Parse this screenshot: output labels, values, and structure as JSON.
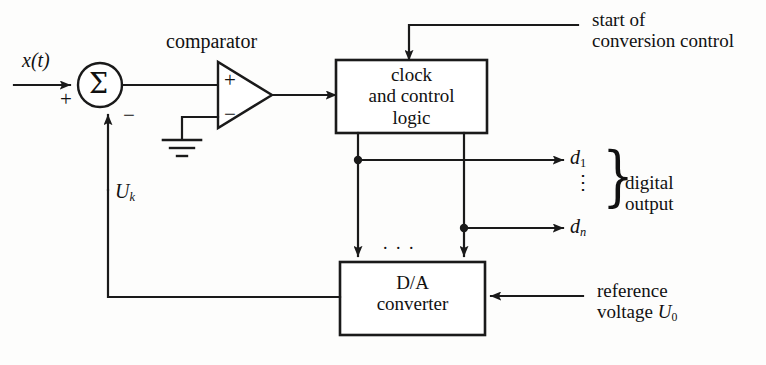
{
  "diagram": {
    "line_color": "#1a1a1a",
    "background": "#fdfdfc",
    "labels": {
      "input_signal": "x",
      "input_signal_arg": "(t)",
      "comparator": "comparator",
      "sum_symbol": "Σ",
      "plus_sign": "+",
      "minus_sign": "−",
      "comparator_plus": "+",
      "comparator_minus": "−",
      "feedback_voltage": "U",
      "feedback_voltage_sub": "k",
      "clock_block_line1": "clock",
      "clock_block_line2": "and control",
      "clock_block_line3": "logic",
      "start_control_line1": "start of",
      "start_control_line2": "conversion control",
      "bit_first": "d",
      "bit_first_sub": "1",
      "bit_last": "d",
      "bit_last_sub": "n",
      "bits_ellipsis": "⋮",
      "digital_output_line1": "digital",
      "digital_output_line2": "output",
      "bus_ellipsis": ". . .",
      "dac_block_line1": "D/A",
      "dac_block_line2": "converter",
      "reference_line1": "reference",
      "reference_line2_text": "voltage",
      "reference_symbol": "U",
      "reference_symbol_sub": "0",
      "output_brace": "}"
    }
  }
}
